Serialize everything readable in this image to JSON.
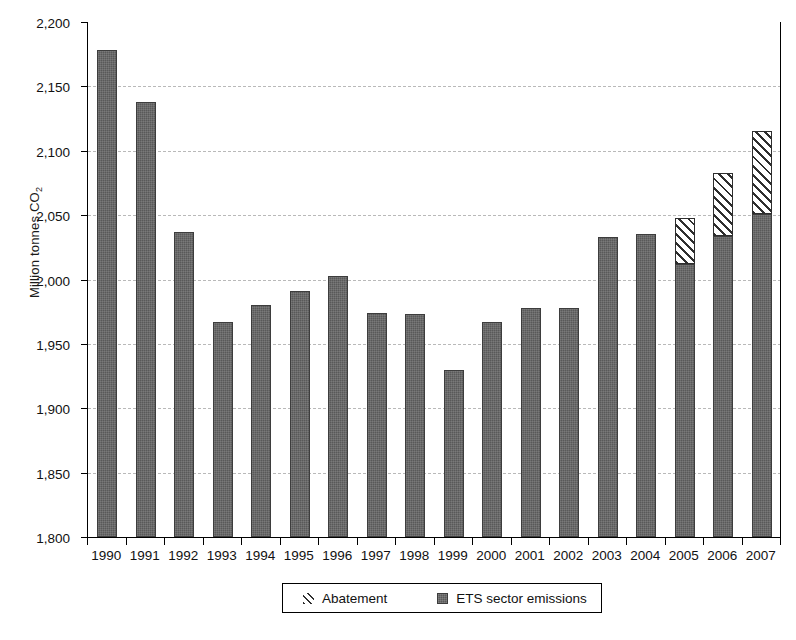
{
  "chart_data": {
    "type": "bar",
    "title": "",
    "subtitle": "",
    "xlabel": "",
    "ylabel": "Million tonnes CO2",
    "ylabel_html": "Million tonnes CO₂",
    "ylim": [
      1800,
      2200
    ],
    "ytick_step": 50,
    "ytick_labels": [
      "2,200",
      "2,150",
      "2,100",
      "2,050",
      "2,000",
      "1,950",
      "1,900",
      "1,850",
      "1,800"
    ],
    "ytick_values": [
      2200,
      2150,
      2100,
      2050,
      2000,
      1950,
      1900,
      1850,
      1800
    ],
    "grid": true,
    "grid_axis": "y",
    "legend_position": "bottom-center",
    "stacked": true,
    "categories": [
      "1990",
      "1991",
      "1992",
      "1993",
      "1994",
      "1995",
      "1996",
      "1997",
      "1998",
      "1999",
      "2000",
      "2001",
      "2002",
      "2003",
      "2004",
      "2005",
      "2006",
      "2007"
    ],
    "series": [
      {
        "name": "ETS sector emissions",
        "color": "#595959",
        "pattern": "solid",
        "values": [
          2178,
          2138,
          2037,
          1967,
          1980,
          1991,
          2003,
          1974,
          1973,
          1930,
          1967,
          1978,
          1978,
          2033,
          2035,
          2012,
          2034,
          2051
        ]
      },
      {
        "name": "Abatement",
        "color": "#ffffff",
        "pattern": "diagonal-hatch",
        "values": [
          0,
          0,
          0,
          0,
          0,
          0,
          0,
          0,
          0,
          0,
          0,
          0,
          0,
          0,
          0,
          36,
          49,
          64
        ]
      }
    ],
    "stack_totals": [
      2178,
      2138,
      2037,
      1967,
      1980,
      1991,
      2003,
      1974,
      1973,
      1930,
      1967,
      1978,
      1978,
      2033,
      2035,
      2048,
      2083,
      2115
    ],
    "legend": [
      {
        "label": "Abatement",
        "swatch": "hatch-swatch"
      },
      {
        "label": "ETS sector emissions",
        "swatch": "solid-swatch"
      }
    ],
    "colors": {
      "bar_emissions": "#595959",
      "bar_abatement_outline": "#2e2e2e",
      "gridline": "#b9b9b9",
      "axis": "#000000",
      "background": "#ffffff"
    }
  }
}
